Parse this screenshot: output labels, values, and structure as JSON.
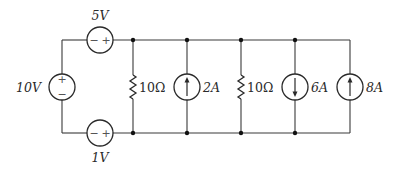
{
  "diagram": {
    "type": "circuit-schematic",
    "colors": {
      "line": "#3a3a3a",
      "background": "#ffffff"
    },
    "voltage_sources": [
      {
        "id": "v10",
        "value": "10",
        "unit": "V",
        "label": "10V",
        "orientation": "vertical",
        "plus": "top",
        "minus": "bottom",
        "plus_sign": "+",
        "minus_sign": "−"
      },
      {
        "id": "v5",
        "value": "5",
        "unit": "V",
        "label": "5V",
        "orientation": "horizontal",
        "plus": "right",
        "minus": "left",
        "plus_sign": "+",
        "minus_sign": "−"
      },
      {
        "id": "v1",
        "value": "1",
        "unit": "V",
        "label": "1V",
        "orientation": "horizontal",
        "plus": "right",
        "minus": "left",
        "plus_sign": "+",
        "minus_sign": "−"
      }
    ],
    "resistors": [
      {
        "id": "r1",
        "value": "10",
        "unit": "Ω",
        "label": "10Ω"
      },
      {
        "id": "r2",
        "value": "10",
        "unit": "Ω",
        "label": "10Ω"
      }
    ],
    "current_sources": [
      {
        "id": "i2",
        "value": "2",
        "unit": "A",
        "label": "2A",
        "direction": "up"
      },
      {
        "id": "i6",
        "value": "6",
        "unit": "A",
        "label": "6A",
        "direction": "down"
      },
      {
        "id": "i8",
        "value": "8",
        "unit": "A",
        "label": "8A",
        "direction": "up"
      }
    ],
    "branch_order_left_to_right": [
      "r1",
      "i2",
      "r2",
      "i6",
      "i8"
    ]
  }
}
